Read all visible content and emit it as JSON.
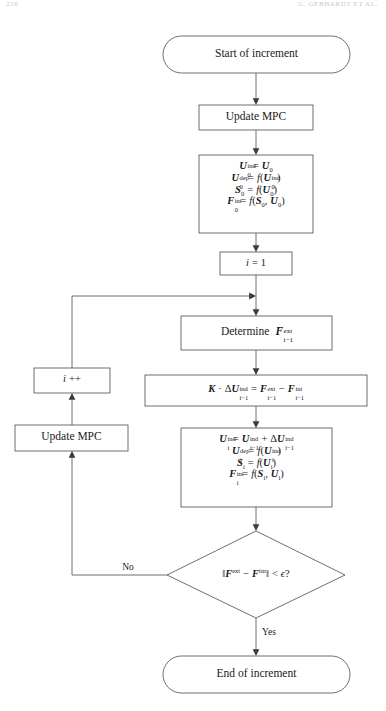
{
  "page": {
    "folio": "226",
    "running_head": "G. GEBHARDT ET AL.",
    "width": 386,
    "height": 711,
    "background": "#ffffff",
    "line_color": "#4a4a4a",
    "text_color": "#1a1a1a"
  },
  "diagram": {
    "type": "flowchart",
    "nodes": [
      {
        "id": "start",
        "shape": "stadium",
        "label": "Start of increment"
      },
      {
        "id": "update-mpc-1",
        "shape": "rect",
        "label": "Update MPC"
      },
      {
        "id": "init",
        "shape": "rect",
        "label": "U0ind = U0 ; U0dep = f(U0ind) ; S0 = f(U0) ; F0int = f(S0, U0)",
        "lines": [
          "U_0^ind = U_0",
          "U_0^dep = f(U_0^ind)",
          "S_0 = f(U_0)",
          "F_0^int = f(S_0, U_0)"
        ]
      },
      {
        "id": "iter-init",
        "shape": "rect",
        "label": "i = 1"
      },
      {
        "id": "determine-f",
        "shape": "rect",
        "label": "Determine F_{i-1}^ext"
      },
      {
        "id": "solve",
        "shape": "rect",
        "label": "K . dU_{i-1}^ind = F_{i-1}^ext - F_{i-1}^int"
      },
      {
        "id": "update-state",
        "shape": "rect",
        "label": "U_i^ind = U_{i-1}^ind + dU_{i-1}^ind ; U_i^dep = f(U_i^ind) ; S_i = f(U_i) ; F_i^int = f(S_i, U_i)",
        "lines": [
          "U_i^ind = U_{i-1}^ind + dU_{i-1}^ind",
          "U_i^dep = f(U_i^ind)",
          "S_i = f(U_i)",
          "F_i^int = f(S_i, U_i)"
        ]
      },
      {
        "id": "converged",
        "shape": "diamond",
        "label": "||F^ext - F^int|| < eps ?"
      },
      {
        "id": "increment-i",
        "shape": "rect",
        "label": "i ++"
      },
      {
        "id": "update-mpc-2",
        "shape": "rect",
        "label": "Update MPC"
      },
      {
        "id": "end",
        "shape": "stadium",
        "label": "End of increment"
      }
    ],
    "edges": [
      {
        "from": "start",
        "to": "update-mpc-1",
        "label": ""
      },
      {
        "from": "update-mpc-1",
        "to": "init",
        "label": ""
      },
      {
        "from": "init",
        "to": "iter-init",
        "label": ""
      },
      {
        "from": "iter-init",
        "to": "determine-f",
        "label": ""
      },
      {
        "from": "determine-f",
        "to": "solve",
        "label": ""
      },
      {
        "from": "solve",
        "to": "update-state",
        "label": ""
      },
      {
        "from": "update-state",
        "to": "converged",
        "label": ""
      },
      {
        "from": "converged",
        "to": "update-mpc-2",
        "label": "No"
      },
      {
        "from": "update-mpc-2",
        "to": "increment-i",
        "label": ""
      },
      {
        "from": "increment-i",
        "to": "determine-f",
        "label": ""
      },
      {
        "from": "converged",
        "to": "end",
        "label": "Yes"
      }
    ],
    "branch_labels": {
      "no": "No",
      "yes": "Yes"
    }
  },
  "text": {
    "start": "Start of increment",
    "update_mpc": "Update MPC",
    "iter_init_var": "i",
    "iter_init_eq": "=",
    "iter_init_val": "1",
    "determine": "Determine",
    "increment_var": "i",
    "increment_op": "++",
    "end": "End of increment",
    "no": "No",
    "yes": "Yes"
  },
  "symbols": {
    "U": "U",
    "F": "F",
    "S": "S",
    "K": "K",
    "f": "f",
    "delta": "Δ",
    "epsilon": "ϵ",
    "dot": "·",
    "minus": "−",
    "plus": "+",
    "equals": "=",
    "less": "<",
    "norm": "‖",
    "question": "?",
    "sup_ind": "ind",
    "sup_dep": "dep",
    "sup_int": "int",
    "sup_ext": "ext",
    "sub_0": "0",
    "sub_i": "i",
    "sub_im1": "i−1"
  }
}
